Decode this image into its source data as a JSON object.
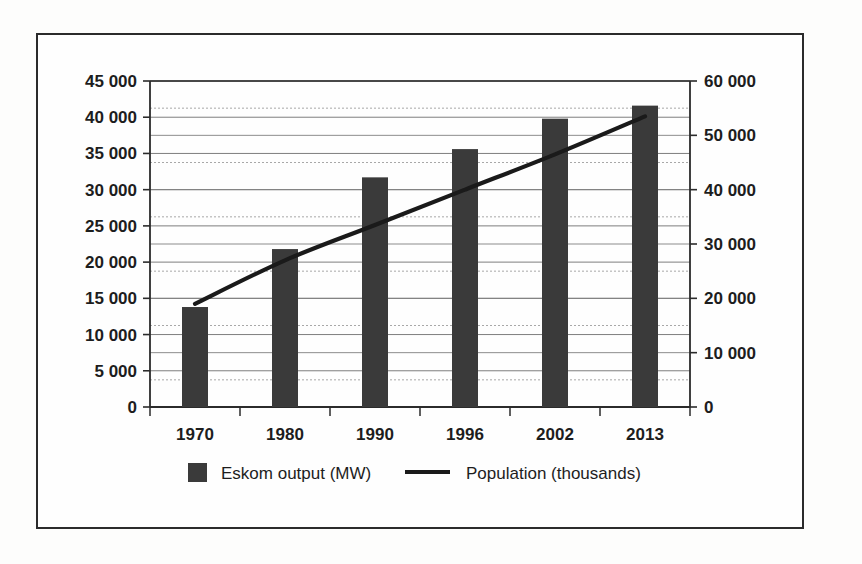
{
  "figure": {
    "frame_border_color": "#2b2b2b",
    "background_color": "#fefefe"
  },
  "chart_data": {
    "type": "bar",
    "title": "",
    "subtitle": "",
    "xlabel": "",
    "ylabel": "",
    "categories": [
      "1970",
      "1980",
      "1990",
      "1996",
      "2002",
      "2013"
    ],
    "series": [
      {
        "name": "Eskom output (MW)",
        "type": "bar",
        "axis": "left",
        "color": "#3a3a3a",
        "values": [
          13800,
          21800,
          31700,
          35600,
          39800,
          41600
        ]
      },
      {
        "name": "Population (thousands)",
        "type": "line",
        "axis": "right",
        "color": "#1a1a1a",
        "values": [
          19000,
          27000,
          33500,
          40000,
          46500,
          53500
        ]
      }
    ],
    "left_axis": {
      "min": 0,
      "max": 45000,
      "step": 5000,
      "ticks": [
        "0",
        "5 000",
        "10 000",
        "15 000",
        "20 000",
        "25 000",
        "30 000",
        "35 000",
        "40 000",
        "45 000"
      ],
      "tick_values": [
        0,
        5000,
        10000,
        15000,
        20000,
        25000,
        30000,
        35000,
        40000,
        45000
      ]
    },
    "right_axis": {
      "min": 0,
      "max": 60000,
      "step": 10000,
      "ticks": [
        "0",
        "10 000",
        "20 000",
        "30 000",
        "40 000",
        "50 000",
        "60 000"
      ],
      "tick_values": [
        0,
        10000,
        20000,
        30000,
        40000,
        50000,
        60000
      ],
      "minor_step": 5000
    },
    "grid": true,
    "legend_position": "bottom"
  },
  "legend": {
    "items": [
      {
        "label": "Eskom output (MW)",
        "marker": "square",
        "color": "#3a3a3a"
      },
      {
        "label": "Population (thousands)",
        "marker": "line",
        "color": "#1a1a1a"
      }
    ]
  }
}
